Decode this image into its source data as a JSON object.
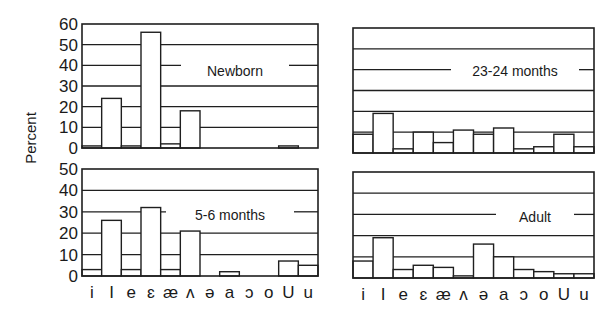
{
  "figure": {
    "ylabel": "Percent",
    "stroke_color": "#1f1f1f",
    "background": "#ffffff"
  },
  "chart_data": [
    {
      "type": "bar",
      "title": "Newborn",
      "position": "top-left",
      "categories": [
        "i",
        "I",
        "e",
        "ɛ",
        "æ",
        "ʌ",
        "ə",
        "a",
        "ɔ",
        "o",
        "U",
        "u"
      ],
      "values": [
        1,
        24,
        1,
        56,
        2,
        18,
        0,
        0,
        0,
        0,
        1,
        0
      ],
      "ylabel": "Percent",
      "ylim": [
        0,
        60
      ],
      "yticks": [
        0,
        10,
        20,
        30,
        40,
        50,
        60
      ],
      "grid": true
    },
    {
      "type": "bar",
      "title": "23-24 months",
      "position": "top-right",
      "categories": [
        "i",
        "I",
        "e",
        "ɛ",
        "æ",
        "ʌ",
        "ə",
        "a",
        "ɔ",
        "o",
        "U",
        "u"
      ],
      "values": [
        9,
        19,
        2,
        10,
        5,
        11,
        9,
        12,
        2,
        3,
        9,
        3
      ],
      "ylabel": "Percent",
      "ylim": [
        0,
        60
      ],
      "yticks": [],
      "grid": true
    },
    {
      "type": "bar",
      "title": "5-6 months",
      "position": "bottom-left",
      "categories": [
        "i",
        "I",
        "e",
        "ɛ",
        "æ",
        "ʌ",
        "ə",
        "a",
        "ɔ",
        "o",
        "U",
        "u"
      ],
      "values": [
        3,
        26,
        3,
        32,
        3,
        21,
        0,
        2,
        0,
        0,
        7,
        5
      ],
      "ylabel": "Percent",
      "ylim": [
        0,
        50
      ],
      "yticks": [
        0,
        10,
        20,
        30,
        40,
        50
      ],
      "grid": true
    },
    {
      "type": "bar",
      "title": "Adult",
      "position": "bottom-right",
      "categories": [
        "i",
        "I",
        "e",
        "ɛ",
        "æ",
        "ʌ",
        "ə",
        "a",
        "ɔ",
        "o",
        "U",
        "u"
      ],
      "values": [
        8,
        19,
        4,
        6,
        5,
        1,
        16,
        10,
        4,
        3,
        2,
        2
      ],
      "ylabel": "Percent",
      "ylim": [
        0,
        50
      ],
      "yticks": [],
      "grid": true
    }
  ],
  "layout": {
    "panels": [
      {
        "x": 82,
        "y": 24,
        "w": 236,
        "h": 124,
        "label_x": 185,
        "label_y": 71,
        "label_w": 100,
        "ticklabels_below": false
      },
      {
        "x": 353,
        "y": 28,
        "w": 241,
        "h": 125,
        "label_x": 455,
        "label_y": 71,
        "label_w": 120,
        "ticklabels_below": false
      },
      {
        "x": 82,
        "y": 169,
        "w": 236,
        "h": 107,
        "label_x": 170,
        "label_y": 215,
        "label_w": 120,
        "ticklabels_below": true
      },
      {
        "x": 353,
        "y": 172,
        "w": 241,
        "h": 106,
        "label_x": 500,
        "label_y": 217,
        "label_w": 70,
        "ticklabels_below": true
      }
    ]
  }
}
